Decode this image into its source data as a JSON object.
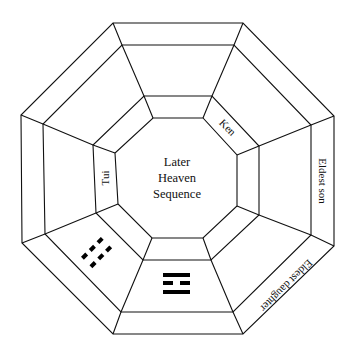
{
  "diagram": {
    "title_lines": [
      "Later",
      "Heaven",
      "Sequence"
    ],
    "labels": {
      "northwest_inner": "Tui",
      "northeast_inner": "Ken",
      "east_outer": "Eldest son",
      "southeast_outer": "Eldest daughter"
    },
    "trigrams": {
      "south": {
        "name": "li-trigram",
        "lines": [
          "solid",
          "broken",
          "solid"
        ]
      },
      "southwest": {
        "name": "kun-trigram",
        "lines": [
          "broken",
          "broken",
          "broken"
        ]
      }
    },
    "colors": {
      "stroke": "#111111",
      "background": "#ffffff"
    }
  }
}
